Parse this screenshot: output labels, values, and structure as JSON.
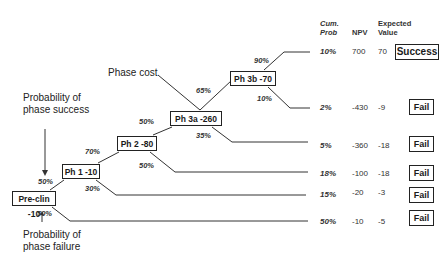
{
  "nodes": [
    {
      "id": "preclin",
      "label": "Pre-clin -10"
    },
    {
      "id": "ph1",
      "label": "Ph 1 -10"
    },
    {
      "id": "ph2",
      "label": "Ph 2 -80"
    },
    {
      "id": "ph3a",
      "label": "Ph 3a -260"
    },
    {
      "id": "ph3b",
      "label": "Ph 3b -70"
    }
  ],
  "branch_probabilities": {
    "preclin_success": "50%",
    "preclin_failure": "50%",
    "ph1_success": "70%",
    "ph1_failure": "30%",
    "ph2_success": "50%",
    "ph2_failure": "50%",
    "ph3a_success": "65%",
    "ph3a_failure": "35%",
    "ph3b_success": "90%",
    "ph3b_failure": "10%"
  },
  "annotations": {
    "phase_cost": "Phase cost",
    "prob_success_line1": "Probability of",
    "prob_success_line2": "phase success",
    "prob_failure_line1": "Probability of",
    "prob_failure_line2": "phase failure"
  },
  "table": {
    "headers": {
      "cum_prob_line1": "Cum.",
      "cum_prob_line2": "Prob",
      "npv": "NPV",
      "ev_line1": "Expected",
      "ev_line2": "Value"
    },
    "rows": [
      {
        "cum_prob": "10%",
        "npv": "700",
        "ev": "70",
        "outcome": "Success"
      },
      {
        "cum_prob": "2%",
        "npv": "-430",
        "ev": "-9",
        "outcome": "Fail"
      },
      {
        "cum_prob": "5%",
        "npv": "-360",
        "ev": "-18",
        "outcome": "Fail"
      },
      {
        "cum_prob": "18%",
        "npv": "-100",
        "ev": "-18",
        "outcome": "Fail"
      },
      {
        "cum_prob": "15%",
        "npv": "-20",
        "ev": "-3",
        "outcome": "Fail"
      },
      {
        "cum_prob": "50%",
        "npv": "-10",
        "ev": "-5",
        "outcome": "Fail"
      }
    ]
  }
}
